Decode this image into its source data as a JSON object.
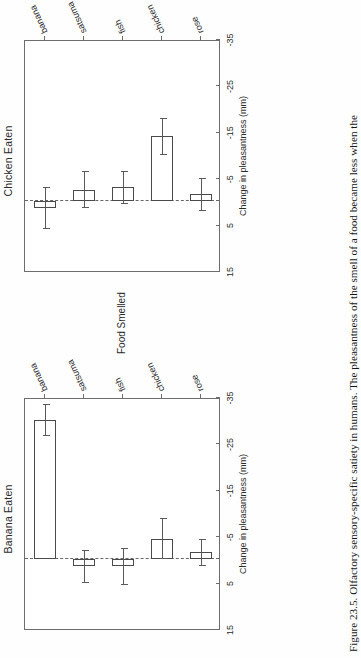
{
  "figure": {
    "caption": "Figure 23.5. Olfactory sensory-specific satiety in humans. The pleasantness of the smell of a food became less when the"
  },
  "axes": {
    "value_axis_title": "Change in pleasantness (mm)",
    "category_axis_title": "Food Smelled",
    "value_ticks": [
      "15",
      "5",
      "-5",
      "-15",
      "-25",
      "-35"
    ],
    "categories": [
      "banana",
      "satsuma",
      "fish",
      "chicken",
      "rose"
    ]
  },
  "panels": [
    {
      "title": "Chicken Eaten"
    },
    {
      "title": "Banana Eaten"
    }
  ],
  "chart_data": {
    "type": "bar",
    "title": "Olfactory sensory-specific satiety in humans",
    "orientation": "horizontal",
    "xlabel": "Food Smelled",
    "ylabel": "Change in pleasantness (mm)",
    "ylim": [
      -35,
      15
    ],
    "yticks": [
      15,
      5,
      -5,
      -15,
      -25,
      -35
    ],
    "grid": false,
    "legend": "none",
    "zero_reference_line": 0,
    "categories": [
      "banana",
      "satsuma",
      "fish",
      "chicken",
      "rose"
    ],
    "panels": [
      {
        "title": "Chicken Eaten",
        "values": [
          1.5,
          -2.5,
          -3.0,
          -14.0,
          -1.5
        ],
        "errors": [
          4.5,
          4.0,
          3.5,
          4.0,
          3.5
        ]
      },
      {
        "title": "Banana Eaten",
        "values": [
          -30.0,
          1.5,
          1.5,
          -4.5,
          -1.5
        ],
        "errors": [
          3.5,
          3.5,
          4.0,
          4.5,
          3.0
        ]
      }
    ]
  }
}
